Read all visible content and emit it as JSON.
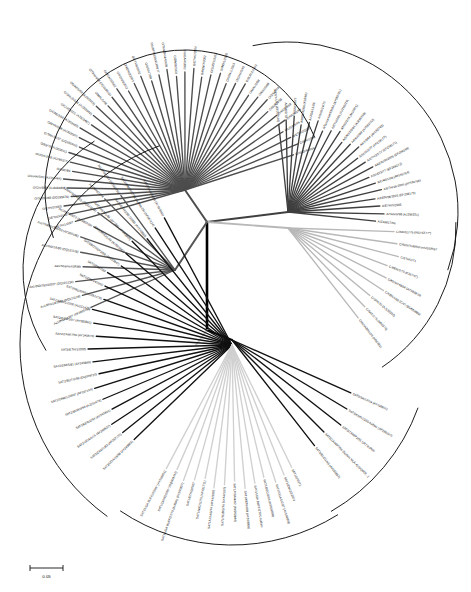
{
  "figure": {
    "type": "unrooted-radial-phylogenetic-tree",
    "scale_bar": {
      "label": "0.05",
      "value": 0.05
    },
    "background": "#ffffff",
    "line_colors": {
      "root": "#000000",
      "serotype_O": "#4d4d4d",
      "serotype_A": "#3f3f3f",
      "serotype_C": "#b8b8b8",
      "serotype_Asia1": "#555555",
      "serotype_SAT1": "#d0d0d0",
      "serotype_SAT2": "#111111",
      "serotype_SAT3": "#111111"
    }
  },
  "chart_data": {
    "type": "tree",
    "title": "",
    "xlabel": "",
    "ylabel": "",
    "grid": false,
    "legend": "none",
    "scale_bar": "0.05",
    "clusters": [
      {
        "name": "O",
        "color": "#4d4d4d",
        "center": {
          "x": 185,
          "y": 190
        },
        "angle_start": -196,
        "angle_end": -18,
        "radius": 118,
        "bracket": {
          "cx": 185,
          "cy": 190,
          "r": 140,
          "a0": -200,
          "a1": -22
        },
        "taxa": [
          "O/ETH/1/2007",
          "O/ETH/3/2003",
          "O/ETH/2/2005",
          "O/SUD/2/86 (DQ165476)",
          "O/CIV/8/99 (AJ303486)",
          "O/GHA/5/93 (AJ303484)",
          "O/KAD/84",
          "O/UGA/3/98 (AJ296327)",
          "O/83/79 (AJ303511)",
          "O/TAN/16/97 (DQ165945)",
          "O/NYA/7/98 (AJ303507)",
          "O/CAE/3/98 (AJ303483)",
          "O/CIV/2/2/01 (AJ303487)",
          "O/SRL/2/2/01 (AJ303502)",
          "O/UAE/1/98 (AJ303509)",
          "O/MAL/1/98",
          "O/TAN/4/98 (DQ165943)",
          "O/UGA/2/2002",
          "O/KEN/9/2002",
          "O/KEN/2/2003",
          "O/ETH/6/2002",
          "O/UGA/7/98",
          "O/UBFS/1980/UKN/77",
          "O/TANZANIA/9/99",
          "O/ZIM/8/2002",
          "O/UGA/4/2002",
          "O/ETH/1/2004",
          "O/KEN/7/2002",
          "O/SUD/1/2003",
          "O/IND/1/2000",
          "O/KEN/1/2003",
          "O/GHA/5/93",
          "O/BUR/2/2002",
          "O/MAL/2/98",
          "O/NIG/5/99",
          "O/ZAI/1/74",
          "O/BUR/3/98",
          "O/KEN/4/98",
          "O/NGR/5/99",
          "O/UGA/5/96",
          "O/ETH/2/2007",
          "O/ERI/1/98",
          "O/SUD/4/2004"
        ]
      },
      {
        "name": "A",
        "color": "#3f3f3f",
        "center": {
          "x": 288,
          "y": 212
        },
        "angle_start": -96,
        "angle_end": 6,
        "radius": 92,
        "bracket": {
          "cx": 288,
          "cy": 212,
          "r": 170,
          "a0": -102,
          "a1": 20
        },
        "taxa": [
          "A/EGY/1/72 (EF208166)",
          "A/IGR/2/73",
          "A/SUD/3/77",
          "A/KEN/42/66 (K18/66)",
          "A/UGA/13/66",
          "A/GHA/14/73",
          "A/TanzaniaKEN/64 (AY593761)",
          "A/ETH/2/81 (AJ296219)",
          "A/NIG/2/76 (M10975)",
          "A/SAU/1/2/91 (AJ296319)",
          "A/ERI/2/98 (AY593762)",
          "A/KEN/64 (AY593763)",
          "A/SUD/3/77 (EF208177)",
          "A/ETH/23/77 (EF208171)",
          "A/KEN/30/2005 (EF208168)",
          "A/SUD/3/77 (EF208172)",
          "A/CAR/1/98 (AY593764)",
          "A/ETH/16/2005 (AY593766)",
          "A/KEN/56/2005 (EF208175)",
          "A/ETH/3/2005",
          "A/TAN/6/98 (AJ296321)",
          "A/ZAM/17/96"
        ]
      },
      {
        "name": "C",
        "color": "#b8b8b8",
        "center": {
          "x": 288,
          "y": 228
        },
        "angle_start": 2,
        "angle_end": 52,
        "radius": 110,
        "bracket": {
          "cx": 288,
          "cy": 228,
          "r": 168,
          "a0": -2,
          "a1": 56
        },
        "taxa": [
          "C/IND/51/79 (IND/42/77*)",
          "C/KEN/Tadjikistan/USSR/67",
          "C/ETH/1/71",
          "C/KEN/2/70 (K267/67)",
          "C/KEN/149/34 (AY593810)",
          "C/KEN/1/86 (C/C) (EU553889)",
          "C/SPA/70 (AJ133357)",
          "C/SAT/1/76 (M90376)",
          "C/INDABRKOS (M90381)"
        ]
      },
      {
        "name": "Asia1",
        "color": "#555555",
        "center": {
          "x": 175,
          "y": 270
        },
        "angle_start": 156,
        "angle_end": 234,
        "radius": 96,
        "bracket": {
          "cx": 175,
          "cy": 270,
          "r": 152,
          "a0": 148,
          "a1": 238
        },
        "taxa": [
          "As1/IND/14/95* (AF390578)",
          "As1/IRN/10/2004 (DQ121128)",
          "As1/IND/762/2003* (DQ101234)",
          "As1/Shamir/ISR/89",
          "As1/IND/16/80 (DQ121118)",
          "As1/YNBS/CHA/58 (AY390436)",
          "As1/IND/63/72 (AY390435)",
          "As1/AFG/1/2001 (DQ121109)",
          "As1/IRN/1974",
          "As1/PAK/1/54 (AY560796)"
        ]
      },
      {
        "name": "SAT3",
        "color": "#111111",
        "center": {
          "x": 232,
          "y": 340
        },
        "angle_start": 24,
        "angle_end": 52,
        "radius": 134,
        "bracket": {
          "cx": 232,
          "cy": 340,
          "r": 198,
          "a0": 20,
          "a1": 60
        },
        "taxa": [
          "SAT3/SA/57/59 (AY593855)",
          "SAT3/KNP/10/90 buffalo (AF286347)",
          "SAT3/ZAM/P2/91 UR7 buffalo",
          "SAT3/ZAM/P2/96 (buffalo MLA-4) (DQ009...)",
          "SAT3/BEC/1/65 (AY593853)"
        ]
      },
      {
        "name": "SAT2",
        "color": "#111111",
        "center": {
          "x": 232,
          "y": 345
        },
        "angle_start": 136,
        "angle_end": 242,
        "radius": 140,
        "bracket": {
          "cx": 232,
          "cy": 345,
          "r": 212,
          "a0": 126,
          "a1": 250
        },
        "taxa": [
          "SAT2/UGA/19/98 (AY343869)",
          "SAT2/ZAM/1/82 (AF367100)",
          "SAT2/UGA/5/15 (AY398637)",
          "SAT2/KEN/2/94 (AY343841)",
          "SAT2/BUR/3/99 (AJ251473)",
          "SAT2/ZAM/1/2000* (AF367134)",
          "SAT2/BOT/1/98 (DQ009720)",
          "SAT2/ZIM/5/81 (AY343899)",
          "SAT2/ETH/1/2005",
          "SAT2/ZAM/7/96 (AY343873)",
          "SAT2/KEN/3/57 (AY593861)",
          "SAT2/SAU/1/2000 (AJ251475)",
          "SAT2/NIG/8/99 (AJ251478)",
          "SAT2/ZIM/14/2002",
          "SAT2/ZIM/7/83",
          "SAT2/BOT/1/P2/98 (AY593847)",
          "SAT2/RHO/1/48 (AY593847)",
          "SAT2/KEN/1/84 (AY7/84) (AY343869)",
          "SAT2/ETH/1/90 (1989) (AY343860)",
          "SAT2/ZIM/P2/2/98 (buffalo 29) (AF367124)",
          "SAT2/SA/1/08/89 (AY593846)"
        ]
      },
      {
        "name": "SAT1",
        "color": "#d0d0d0",
        "center": {
          "x": 232,
          "y": 345
        },
        "angle_start": 64,
        "angle_end": 118,
        "radius": 140,
        "bracket": {
          "cx": 232,
          "cy": 345,
          "r": 200,
          "a0": 58,
          "a1": 124
        },
        "taxa": [
          "SAT1/1/55/71",
          "SAT1/ZIM/22/2003",
          "SAT1/UGA/1/2/27 (AY593858)",
          "SAT1/BEC/1/66 (AY593858)",
          "SAT1/UGA BUFF/27/70 buffalo",
          "SAT1/KEN/4/98 (AY593856)",
          "SAT1/RSA/4/92 (AY593844)",
          "SAT1/SUD/3/74 (AY442012)",
          "SAT1/UGA/3/74 (AY442010)",
          "SAT1/NIG/11/75 (AF431711)",
          "SAT1/ETH/3/2007",
          "SAT1/UGA BUFF/27/70 (buffalo) (AY593857)",
          "SAT1/GHA/2/2/91* (DQ009742)",
          "SAT1/UGA BUFF/2/2/91* (AY593851)"
        ]
      }
    ]
  },
  "scale": {
    "label": "0.05"
  }
}
